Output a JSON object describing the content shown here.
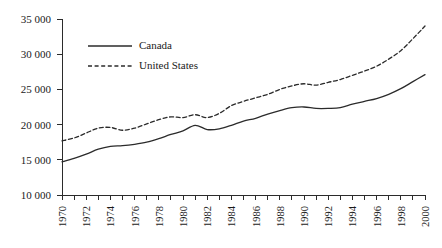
{
  "chart_data": {
    "type": "line",
    "title": "",
    "subtitle": "",
    "xlabel": "",
    "ylabel": "",
    "xlim": [
      1970,
      2000
    ],
    "ylim": [
      10000,
      35000
    ],
    "grid": false,
    "legend_position": "upper-left-inside",
    "y_ticks": [
      10000,
      15000,
      20000,
      25000,
      30000,
      35000
    ],
    "y_tick_labels": [
      "10 000",
      "15 000",
      "20 000",
      "25 000",
      "30 000",
      "35 000"
    ],
    "x_ticks": [
      1970,
      1971,
      1972,
      1973,
      1974,
      1975,
      1976,
      1977,
      1978,
      1979,
      1980,
      1981,
      1982,
      1983,
      1984,
      1985,
      1986,
      1987,
      1988,
      1989,
      1990,
      1991,
      1992,
      1993,
      1994,
      1995,
      1996,
      1997,
      1998,
      1999,
      2000
    ],
    "x_tick_labels": [
      "1970",
      "",
      "1972",
      "",
      "1974",
      "",
      "1976",
      "",
      "1978",
      "",
      "1980",
      "",
      "1982",
      "",
      "1984",
      "",
      "1986",
      "",
      "1988",
      "",
      "1990",
      "",
      "1992",
      "",
      "1994",
      "",
      "1996",
      "",
      "1998",
      "",
      "2000"
    ],
    "x": [
      1970,
      1971,
      1972,
      1973,
      1974,
      1975,
      1976,
      1977,
      1978,
      1979,
      1980,
      1981,
      1982,
      1983,
      1984,
      1985,
      1986,
      1987,
      1988,
      1989,
      1990,
      1991,
      1992,
      1993,
      1994,
      1995,
      1996,
      1997,
      1998,
      1999,
      2000
    ],
    "series": [
      {
        "name": "Canada",
        "style": "solid",
        "color": "#2b2b2b",
        "values": [
          14700,
          15200,
          15800,
          16500,
          16900,
          17000,
          17200,
          17500,
          18000,
          18600,
          19100,
          19900,
          19300,
          19400,
          19900,
          20500,
          20900,
          21500,
          22000,
          22400,
          22500,
          22300,
          22300,
          22400,
          22900,
          23300,
          23700,
          24300,
          25100,
          26100,
          27100
        ]
      },
      {
        "name": "United States",
        "style": "dashed",
        "color": "#2b2b2b",
        "values": [
          17700,
          18100,
          18800,
          19500,
          19600,
          19200,
          19500,
          20100,
          20700,
          21100,
          21000,
          21400,
          21000,
          21600,
          22700,
          23300,
          23800,
          24300,
          25000,
          25500,
          25800,
          25600,
          26000,
          26400,
          27000,
          27600,
          28300,
          29300,
          30500,
          32200,
          34000
        ]
      }
    ],
    "legend": [
      {
        "label": "Canada",
        "style": "solid"
      },
      {
        "label": "United States",
        "style": "dashed"
      }
    ]
  }
}
